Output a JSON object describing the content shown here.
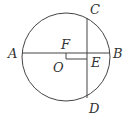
{
  "diagram": {
    "labels": {
      "A": "A",
      "B": "B",
      "C": "C",
      "D": "D",
      "E": "E",
      "F": "F",
      "O": "O"
    },
    "stroke_color": "#444444"
  }
}
